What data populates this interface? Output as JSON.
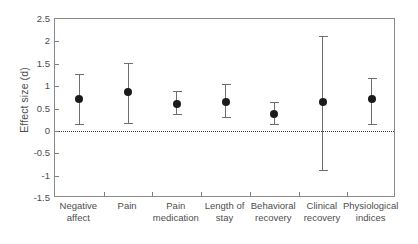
{
  "chart_data": {
    "type": "scatter",
    "title": "",
    "xlabel": "",
    "ylabel": "Effect size (d)",
    "ylim": [
      -1.5,
      2.5
    ],
    "yticks": [
      "2.5",
      "2",
      "1.5",
      "1",
      "0.5",
      "0",
      "-0.5",
      "-1",
      "-1.5"
    ],
    "ytick_values": [
      2.5,
      2,
      1.5,
      1,
      0.5,
      0,
      -0.5,
      -1,
      -1.5
    ],
    "grid": false,
    "legend": "none",
    "reference_line": 0,
    "error_bar_type": "95% confidence interval",
    "categories": [
      "Negative affect",
      "Pain",
      "Pain medication",
      "Length of stay",
      "Behavioral recovery",
      "Clinical recovery",
      "Physiological indices"
    ],
    "category_lines": [
      [
        "Negative",
        "affect"
      ],
      [
        "Pain",
        ""
      ],
      [
        "Pain",
        "medication"
      ],
      [
        "Length of",
        "stay"
      ],
      [
        "Behavioral",
        "recovery"
      ],
      [
        "Clinical",
        "recovery"
      ],
      [
        "Physiological",
        "indices"
      ]
    ],
    "values": [
      0.72,
      0.87,
      0.6,
      0.65,
      0.38,
      0.65,
      0.72
    ],
    "ci_lower": [
      0.15,
      0.17,
      0.38,
      0.32,
      0.15,
      -0.87,
      0.15
    ],
    "ci_upper": [
      1.28,
      1.51,
      0.88,
      1.05,
      0.65,
      2.12,
      1.18
    ],
    "points": [
      {
        "category": "Negative affect",
        "value": 0.72,
        "ci_lower": 0.15,
        "ci_upper": 1.28
      },
      {
        "category": "Pain",
        "value": 0.87,
        "ci_lower": 0.17,
        "ci_upper": 1.51
      },
      {
        "category": "Pain medication",
        "value": 0.6,
        "ci_lower": 0.38,
        "ci_upper": 0.88
      },
      {
        "category": "Length of stay",
        "value": 0.65,
        "ci_lower": 0.32,
        "ci_upper": 1.05
      },
      {
        "category": "Behavioral recovery",
        "value": 0.38,
        "ci_lower": 0.15,
        "ci_upper": 0.65
      },
      {
        "category": "Clinical recovery",
        "value": 0.65,
        "ci_lower": -0.87,
        "ci_upper": 2.12
      },
      {
        "category": "Physiological indices",
        "value": 0.72,
        "ci_lower": 0.15,
        "ci_upper": 1.18
      }
    ],
    "colors": {
      "marker": "#1a1a1a",
      "whisker": "#6e6e6e",
      "axis": "#8a8a8a",
      "text": "#4d4d4d",
      "zero_line": "#3a3a3a",
      "background": "#ffffff"
    }
  }
}
